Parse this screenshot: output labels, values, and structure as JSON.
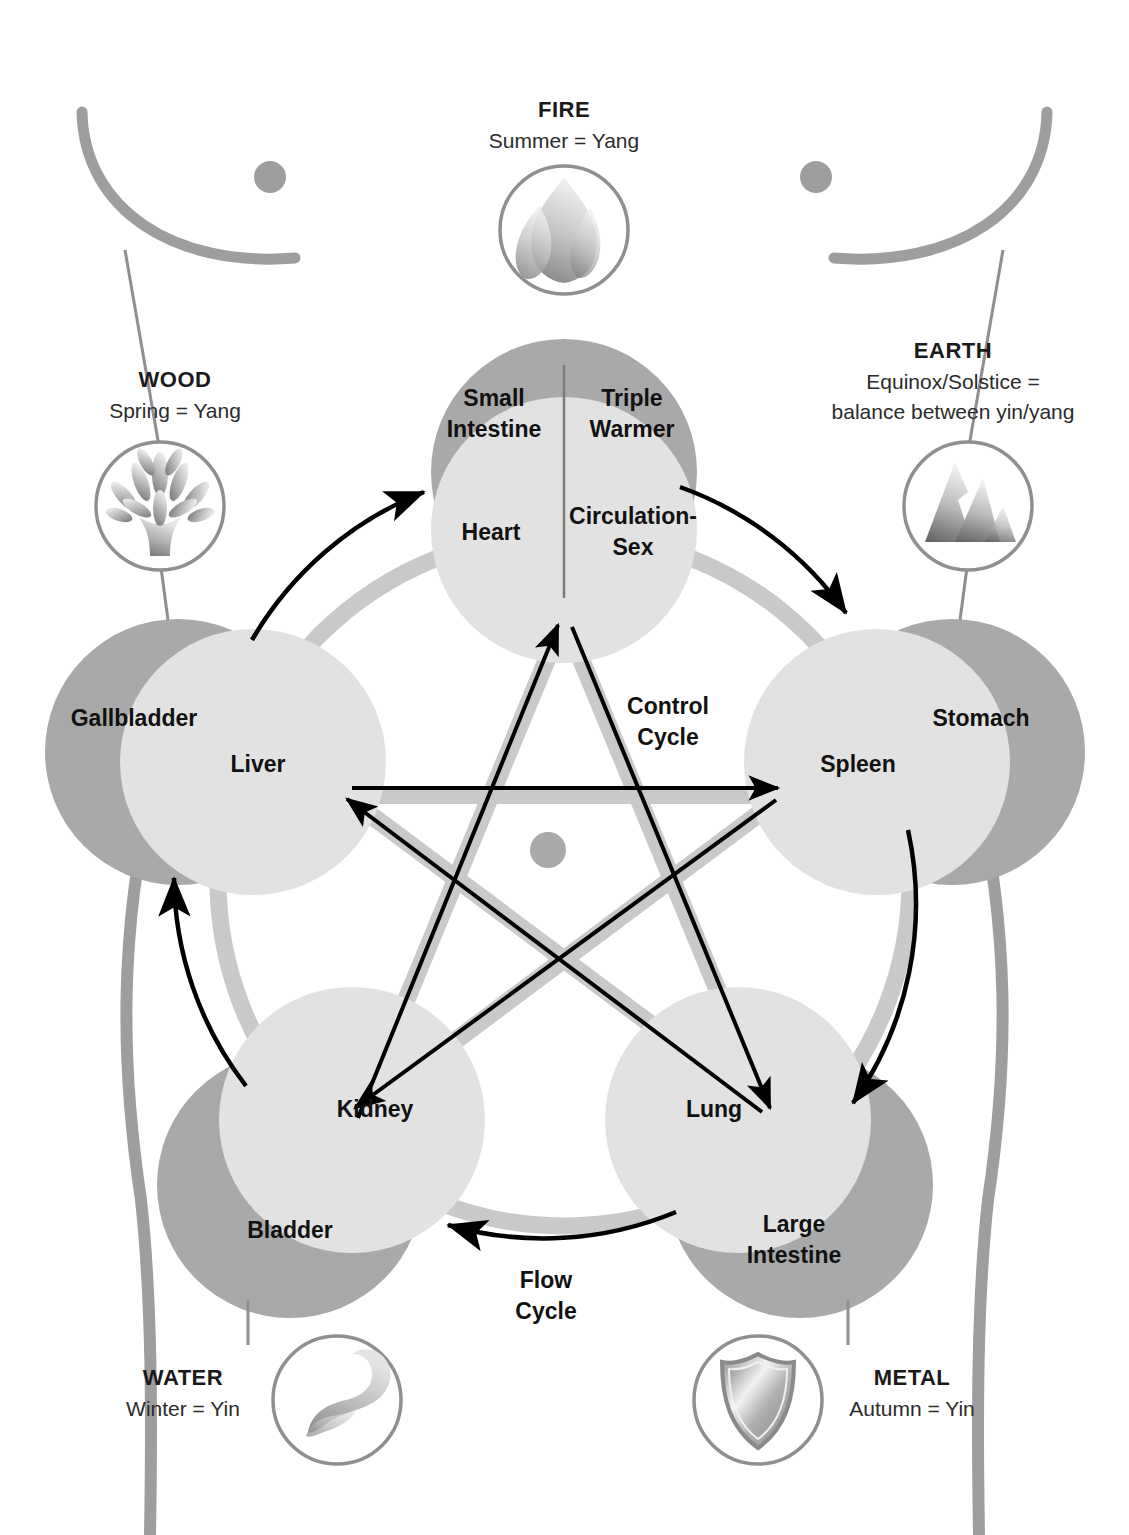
{
  "diagram": {
    "colors": {
      "yang_circle": "#a9a9a9",
      "yin_circle": "#e2e2e2",
      "pentagram_stroke": "#c9c9c9",
      "flow_ring": "#c9c9c9",
      "body_outline": "#9e9e9e",
      "arrow": "#000000",
      "text": "#111111",
      "icon_ring": "#8f8f8f"
    }
  },
  "elements": [
    {
      "key": "fire",
      "name": "FIRE",
      "season": "Summer = Yang",
      "icon": "flame-icon",
      "yang_organ": "Small Intestine",
      "yang_organ_2": "Triple Warmer",
      "yin_organ": "Heart",
      "yin_organ_2": "Circulation-Sex"
    },
    {
      "key": "wood",
      "name": "WOOD",
      "season": "Spring = Yang",
      "icon": "tree-icon",
      "yang_organ": "Gallbladder",
      "yin_organ": "Liver"
    },
    {
      "key": "earth",
      "name": "EARTH",
      "season_line1": "Equinox/Solstice =",
      "season_line2": "balance between yin/yang",
      "icon": "mountain-icon",
      "yang_organ": "Stomach",
      "yin_organ": "Spleen"
    },
    {
      "key": "metal",
      "name": "METAL",
      "season": "Autumn = Yin",
      "icon": "shield-icon",
      "yang_organ": "Large Intestine",
      "yin_organ": "Lung"
    },
    {
      "key": "water",
      "name": "WATER",
      "season": "Winter = Yin",
      "icon": "wave-icon",
      "yang_organ": "Bladder",
      "yin_organ": "Kidney"
    }
  ],
  "cycles": {
    "control": "Control\nCycle",
    "control_line1": "Control",
    "control_line2": "Cycle",
    "flow": "Flow\nCycle",
    "flow_line1": "Flow",
    "flow_line2": "Cycle"
  },
  "organs": {
    "small_intestine": "Small",
    "small_intestine_2": "Intestine",
    "triple_warmer": "Triple",
    "triple_warmer_2": "Warmer",
    "heart": "Heart",
    "circulation_sex": "Circulation-",
    "circulation_sex_2": "Sex",
    "gallbladder": "Gallbladder",
    "liver": "Liver",
    "stomach": "Stomach",
    "spleen": "Spleen",
    "kidney": "Kidney",
    "bladder": "Bladder",
    "lung": "Lung",
    "large_intestine": "Large",
    "large_intestine_2": "Intestine"
  }
}
